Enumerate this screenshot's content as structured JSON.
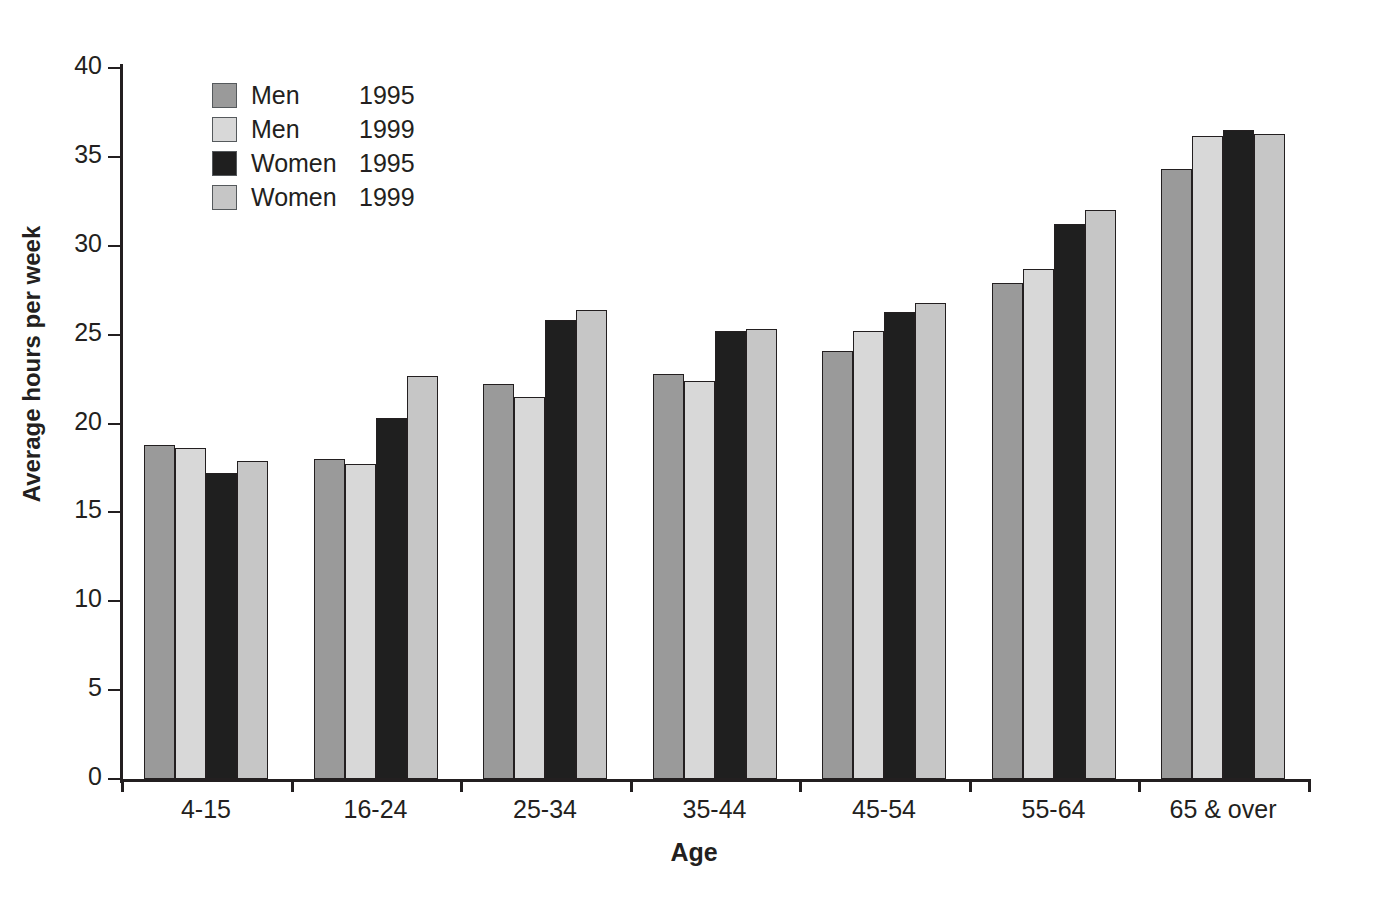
{
  "chart_data": {
    "type": "bar",
    "title": "",
    "xlabel": "Age",
    "ylabel": "Average hours per week",
    "categories": [
      "4-15",
      "16-24",
      "25-34",
      "35-44",
      "45-54",
      "55-64",
      "65 & over"
    ],
    "series": [
      {
        "name": "Men 1995",
        "group": "Men",
        "year": "1995",
        "color": "#9a9a9a",
        "values": [
          18.8,
          18.0,
          22.2,
          22.8,
          24.1,
          27.9,
          34.3
        ]
      },
      {
        "name": "Men 1999",
        "group": "Men",
        "year": "1999",
        "color": "#d8d8d8",
        "values": [
          18.6,
          17.7,
          21.5,
          22.4,
          25.2,
          28.7,
          36.2
        ]
      },
      {
        "name": "Women 1995",
        "group": "Women",
        "year": "1995",
        "color": "#1f1f1f",
        "values": [
          17.2,
          20.3,
          25.8,
          25.2,
          26.3,
          31.2,
          36.5
        ]
      },
      {
        "name": "Women 1999",
        "group": "Women",
        "year": "1999",
        "color": "#c6c6c6",
        "values": [
          17.9,
          22.7,
          26.4,
          25.3,
          26.8,
          32.0,
          36.3
        ]
      }
    ],
    "ylim": [
      0,
      40
    ],
    "yticks": [
      0,
      5,
      10,
      15,
      20,
      25,
      30,
      35,
      40
    ],
    "ytick_labels": [
      "0",
      "5",
      "10",
      "15",
      "20",
      "25",
      "30",
      "35",
      "40"
    ],
    "grid": false,
    "legend_position": "top-left"
  },
  "legend": {
    "entries": [
      {
        "label": "Men",
        "year": "1995"
      },
      {
        "label": "Men",
        "year": "1999"
      },
      {
        "label": "Women",
        "year": "1995"
      },
      {
        "label": "Women",
        "year": "1999"
      }
    ]
  },
  "axes": {
    "y_title": "Average hours per week",
    "x_title": "Age"
  }
}
